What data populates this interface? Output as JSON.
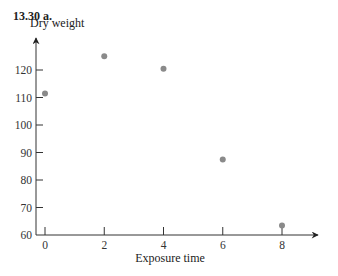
{
  "problem_label": "13.30  a.",
  "chart_data": {
    "type": "scatter",
    "title": "",
    "xlabel": "Exposure time",
    "ylabel": "Dry weight",
    "x": [
      0,
      2,
      4,
      6,
      8
    ],
    "y": [
      111.5,
      125,
      120.5,
      87.5,
      63.5
    ],
    "xlim": [
      -0.3,
      9.3
    ],
    "ylim": [
      60,
      128
    ],
    "x_ticks": [
      0,
      2,
      4,
      6,
      8
    ],
    "y_ticks": [
      60,
      70,
      80,
      90,
      100,
      110,
      120
    ],
    "grid": false,
    "marker_color": "#8a8a8a",
    "axis_color": "#333333"
  }
}
